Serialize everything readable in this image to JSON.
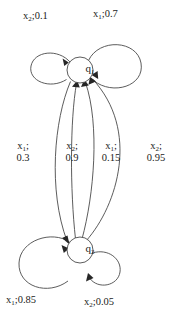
{
  "diagram": {
    "type": "probabilistic-state-transition-diagram",
    "states": [
      {
        "id": "q1",
        "label": "q",
        "subscript": "1",
        "cx": 80,
        "cy": 70,
        "r": 13
      },
      {
        "id": "q2",
        "label": "q",
        "subscript": "2",
        "cx": 80,
        "cy": 250,
        "r": 13
      }
    ],
    "self_loops": [
      {
        "id": "loop-q1-left",
        "state": "q1",
        "symbol": "x",
        "symbol_subscript": "2",
        "probability": "0.1",
        "label_text": "x2;0.1",
        "side": "left",
        "size": "small"
      },
      {
        "id": "loop-q1-right",
        "state": "q1",
        "symbol": "x",
        "symbol_subscript": "1",
        "probability": "0.7",
        "label_text": "x1;0.7",
        "side": "right",
        "size": "large"
      },
      {
        "id": "loop-q2-left",
        "state": "q2",
        "symbol": "x",
        "symbol_subscript": "1",
        "probability": "0.85",
        "label_text": "x1;0.85",
        "side": "left",
        "size": "large"
      },
      {
        "id": "loop-q2-right",
        "state": "q2",
        "symbol": "x",
        "symbol_subscript": "2",
        "probability": "0.05",
        "label_text": "x2;0.05",
        "side": "right",
        "size": "small"
      }
    ],
    "transitions": [
      {
        "id": "edge-q1-q2-x1",
        "from": "q1",
        "to": "q2",
        "symbol": "x",
        "symbol_subscript": "1",
        "probability": "0.3",
        "label_line1": "x1;",
        "label_line2": "0.3"
      },
      {
        "id": "edge-q2-q1-x2-09",
        "from": "q2",
        "to": "q1",
        "symbol": "x",
        "symbol_subscript": "2",
        "probability": "0.9",
        "label_line1": "x2;",
        "label_line2": "0.9"
      },
      {
        "id": "edge-q2-q1-x1-015",
        "from": "q2",
        "to": "q1",
        "symbol": "x",
        "symbol_subscript": "1",
        "probability": "0.15",
        "label_line1": "x1;",
        "label_line2": "0.15"
      },
      {
        "id": "edge-q2-q1-x2-095",
        "from": "q2",
        "to": "q1",
        "symbol": "x",
        "symbol_subscript": "2",
        "probability": "0.95",
        "label_line1": "x2;",
        "label_line2": "0.95"
      }
    ],
    "labels": {
      "q1_name": "q",
      "q1_sub": "1",
      "q2_name": "q",
      "q2_sub": "2",
      "top_left_symbol": "x",
      "top_left_sub": "2",
      "top_left_sep": ";",
      "top_left_prob": "0.1",
      "top_right_symbol": "x",
      "top_right_sub": "1",
      "top_right_sep": ";",
      "top_right_prob": "0.7",
      "mid1_symbol": "x",
      "mid1_sub": "1",
      "mid1_sep": ";",
      "mid1_prob": "0.3",
      "mid2_symbol": "x",
      "mid2_sub": "2",
      "mid2_sep": ";",
      "mid2_prob": "0.9",
      "mid3_symbol": "x",
      "mid3_sub": "1",
      "mid3_sep": ";",
      "mid3_prob": "0.15",
      "mid4_symbol": "x",
      "mid4_sub": "2",
      "mid4_sep": ";",
      "mid4_prob": "0.95",
      "bottom_left_symbol": "x",
      "bottom_left_sub": "1",
      "bottom_left_sep": ";",
      "bottom_left_prob": "0.85",
      "bottom_right_symbol": "x",
      "bottom_right_sub": "2",
      "bottom_right_sep": ";",
      "bottom_right_prob": "0.05"
    },
    "colors": {
      "stroke": "#4a4a4a",
      "arrow": "#262626",
      "text": "#1a1a1a",
      "background": "#ffffff"
    }
  }
}
